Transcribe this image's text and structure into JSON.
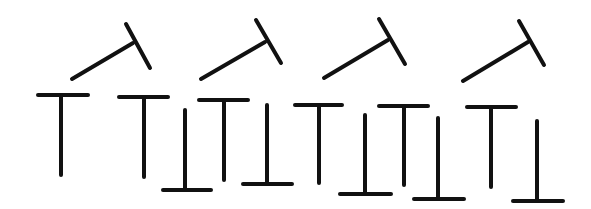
{
  "diagram": {
    "width": 591,
    "height": 209,
    "background": "#ffffff",
    "stroke_color": "#111111",
    "stroke_width": 4,
    "groups": [
      {
        "name": "rotated-t-row",
        "shapes": [
          {
            "type": "rotated-T",
            "stem": [
              72,
              79,
              133,
              43
            ],
            "bar": [
              126,
              24,
              150,
              68
            ]
          },
          {
            "type": "rotated-T",
            "stem": [
              201,
              79,
              265,
              42
            ],
            "bar": [
              256,
              20,
              281,
              63
            ]
          },
          {
            "type": "rotated-T",
            "stem": [
              324,
              78,
              388,
              40
            ],
            "bar": [
              379,
              19,
              405,
              64
            ]
          },
          {
            "type": "rotated-T",
            "stem": [
              463,
              81,
              528,
              42
            ],
            "bar": [
              519,
              21,
              544,
              65
            ]
          }
        ]
      },
      {
        "name": "upright-and-inverted-t-row",
        "shapes": [
          {
            "type": "upright-T",
            "bar": [
              38,
              95,
              88,
              95
            ],
            "stem": [
              61,
              95,
              61,
              175
            ]
          },
          {
            "type": "upright-T",
            "bar": [
              119,
              97,
              168,
              97
            ],
            "stem": [
              144,
              97,
              144,
              177
            ]
          },
          {
            "type": "inverted-T",
            "stem": [
              185,
              110,
              185,
              190
            ],
            "bar": [
              163,
              190,
              211,
              190
            ]
          },
          {
            "type": "upright-T",
            "bar": [
              199,
              100,
              248,
              100
            ],
            "stem": [
              224,
              100,
              224,
              180
            ]
          },
          {
            "type": "inverted-T",
            "stem": [
              267,
              105,
              267,
              184
            ],
            "bar": [
              243,
              184,
              292,
              184
            ]
          },
          {
            "type": "upright-T",
            "bar": [
              295,
              105,
              342,
              105
            ],
            "stem": [
              319,
              105,
              319,
              183
            ]
          },
          {
            "type": "inverted-T",
            "stem": [
              365,
              115,
              365,
              194
            ],
            "bar": [
              340,
              194,
              391,
              194
            ]
          },
          {
            "type": "upright-T",
            "bar": [
              379,
              106,
              428,
              106
            ],
            "stem": [
              404,
              106,
              404,
              185
            ]
          },
          {
            "type": "inverted-T",
            "stem": [
              438,
              118,
              438,
              199
            ],
            "bar": [
              414,
              199,
              464,
              199
            ]
          },
          {
            "type": "upright-T",
            "bar": [
              467,
              107,
              516,
              107
            ],
            "stem": [
              491,
              107,
              491,
              187
            ]
          },
          {
            "type": "inverted-T",
            "stem": [
              537,
              121,
              537,
              201
            ],
            "bar": [
              513,
              201,
              563,
              201
            ]
          }
        ]
      }
    ]
  }
}
